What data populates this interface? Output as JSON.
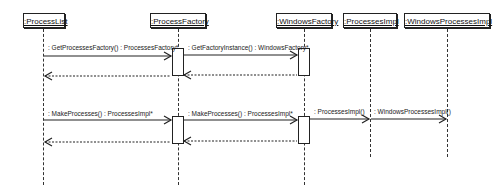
{
  "lifelines": [
    {
      "name": ":ProcessList",
      "x": 43
    },
    {
      "name": ":ProcessFactory",
      "x": 178
    },
    {
      "name": ":WindowsFactory",
      "x": 304
    },
    {
      "name": ":ProcessesImpl",
      "x": 370
    },
    {
      "name": ":WindowsProcessesImpl",
      "x": 447
    }
  ],
  "messages": [
    {
      "label": ": GetProcessesFactory() : ProcessesFactory*",
      "type": "call",
      "from": ":ProcessList",
      "to": ":ProcessFactory"
    },
    {
      "label": ": GetFactoryInstance() : WindowsFactory*",
      "type": "call",
      "from": ":ProcessFactory",
      "to": ":WindowsFactory"
    },
    {
      "label": "",
      "type": "return",
      "from": ":WindowsFactory",
      "to": ":ProcessFactory"
    },
    {
      "label": "",
      "type": "return",
      "from": ":ProcessFactory",
      "to": ":ProcessList"
    },
    {
      "label": ": MakeProcesses() : ProcessesImpl*",
      "type": "call",
      "from": ":ProcessList",
      "to": ":ProcessFactory"
    },
    {
      "label": ": MakeProcesses() : ProcessesImpl*",
      "type": "call",
      "from": ":ProcessFactory",
      "to": ":WindowsFactory"
    },
    {
      "label": ": ProcessesImpl()",
      "type": "create",
      "from": ":WindowsFactory",
      "to": ":ProcessesImpl"
    },
    {
      "label": ": WindowsProcessesImpl()",
      "type": "create",
      "from": ":ProcessesImpl",
      "to": ":WindowsProcessesImpl"
    },
    {
      "label": "",
      "type": "return",
      "from": ":WindowsFactory",
      "to": ":ProcessFactory"
    },
    {
      "label": "",
      "type": "return",
      "from": ":ProcessFactory",
      "to": ":ProcessList"
    }
  ]
}
